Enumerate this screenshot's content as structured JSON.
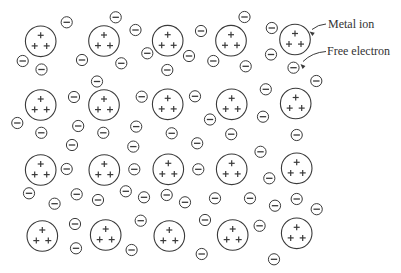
{
  "figure": {
    "colors": {
      "stroke": "#3a3a3a",
      "text": "#333333",
      "background": "#ffffff"
    },
    "ion_radius": 15.3,
    "ion_charge_symbol": "+",
    "ion_charges_per_ion": 3,
    "electron_radius": 5.6,
    "electron_charge_symbol": "−",
    "labels": {
      "metal_ion": {
        "text": "Metal ion",
        "x": 328,
        "y": 27.5
      },
      "free_electron": {
        "text": "Free electron",
        "x": 327,
        "y": 55
      }
    },
    "leaders": [
      {
        "name": "metal-ion-leader",
        "d": "M 326 24 Q 318 24.5 312 29.5",
        "tip": [
          309.5,
          31.5
        ],
        "angle": 145
      },
      {
        "name": "free-electron-leader",
        "d": "M 326 51.5 Q 312 52.5 303 61.5",
        "tip": [
          300.5,
          64
        ],
        "angle": 135
      }
    ],
    "metal_ions": [
      {
        "x": 40.7,
        "y": 41.3
      },
      {
        "x": 104.0,
        "y": 41.0
      },
      {
        "x": 167.7,
        "y": 40.7
      },
      {
        "x": 231.0,
        "y": 40.7
      },
      {
        "x": 295.0,
        "y": 39.5
      },
      {
        "x": 40.7,
        "y": 105.0
      },
      {
        "x": 104.0,
        "y": 105.0
      },
      {
        "x": 167.7,
        "y": 104.3
      },
      {
        "x": 231.7,
        "y": 104.3
      },
      {
        "x": 295.7,
        "y": 103.5
      },
      {
        "x": 40.7,
        "y": 170.0
      },
      {
        "x": 104.3,
        "y": 170.0
      },
      {
        "x": 168.3,
        "y": 169.3
      },
      {
        "x": 231.7,
        "y": 169.3
      },
      {
        "x": 296.7,
        "y": 168.3
      },
      {
        "x": 42.3,
        "y": 236.0
      },
      {
        "x": 105.7,
        "y": 235.0
      },
      {
        "x": 169.3,
        "y": 236.0
      },
      {
        "x": 232.7,
        "y": 235.0
      },
      {
        "x": 296.7,
        "y": 233.3
      }
    ],
    "free_electrons": [
      {
        "x": 66.7,
        "y": 22.3
      },
      {
        "x": 115.7,
        "y": 17.3
      },
      {
        "x": 135.5,
        "y": 30.0
      },
      {
        "x": 22.7,
        "y": 61.0
      },
      {
        "x": 41.5,
        "y": 69.5
      },
      {
        "x": 82.0,
        "y": 60.0
      },
      {
        "x": 121.3,
        "y": 63.3
      },
      {
        "x": 97.0,
        "y": 81.5
      },
      {
        "x": 147.3,
        "y": 53.3
      },
      {
        "x": 167.3,
        "y": 70.0
      },
      {
        "x": 189.0,
        "y": 56.0
      },
      {
        "x": 201.0,
        "y": 31.0
      },
      {
        "x": 244.5,
        "y": 17.0
      },
      {
        "x": 213.3,
        "y": 61.0
      },
      {
        "x": 245.7,
        "y": 66.3
      },
      {
        "x": 271.8,
        "y": 28.0
      },
      {
        "x": 271.0,
        "y": 54.5
      },
      {
        "x": 293.5,
        "y": 67.7
      },
      {
        "x": 316.3,
        "y": 81.0
      },
      {
        "x": 265.8,
        "y": 89.3
      },
      {
        "x": 74.0,
        "y": 97.0
      },
      {
        "x": 17.3,
        "y": 123.0
      },
      {
        "x": 41.3,
        "y": 132.8
      },
      {
        "x": 78.2,
        "y": 126.0
      },
      {
        "x": 103.3,
        "y": 132.8
      },
      {
        "x": 72.0,
        "y": 145.0
      },
      {
        "x": 136.2,
        "y": 126.6
      },
      {
        "x": 133.3,
        "y": 146.6
      },
      {
        "x": 141.7,
        "y": 96.7
      },
      {
        "x": 195.0,
        "y": 96.3
      },
      {
        "x": 210.0,
        "y": 119.5
      },
      {
        "x": 171.7,
        "y": 133.3
      },
      {
        "x": 231.2,
        "y": 134.2
      },
      {
        "x": 197.2,
        "y": 143.3
      },
      {
        "x": 263.0,
        "y": 116.7
      },
      {
        "x": 296.7,
        "y": 135.0
      },
      {
        "x": 260.5,
        "y": 151.8
      },
      {
        "x": 66.7,
        "y": 169.0
      },
      {
        "x": 29.0,
        "y": 193.3
      },
      {
        "x": 54.6,
        "y": 203.7
      },
      {
        "x": 76.7,
        "y": 194.3
      },
      {
        "x": 98.0,
        "y": 200.0
      },
      {
        "x": 125.8,
        "y": 191.3
      },
      {
        "x": 134.3,
        "y": 169.3
      },
      {
        "x": 198.3,
        "y": 169.3
      },
      {
        "x": 144.0,
        "y": 197.3
      },
      {
        "x": 166.7,
        "y": 195.0
      },
      {
        "x": 185.0,
        "y": 202.3
      },
      {
        "x": 215.0,
        "y": 198.3
      },
      {
        "x": 250.0,
        "y": 198.3
      },
      {
        "x": 269.3,
        "y": 178.3
      },
      {
        "x": 275.0,
        "y": 205.7
      },
      {
        "x": 296.7,
        "y": 199.0
      },
      {
        "x": 316.7,
        "y": 209.2
      },
      {
        "x": 75.0,
        "y": 224.0
      },
      {
        "x": 76.0,
        "y": 248.3
      },
      {
        "x": 131.6,
        "y": 250.0
      },
      {
        "x": 140.7,
        "y": 220.7
      },
      {
        "x": 205.0,
        "y": 220.0
      },
      {
        "x": 201.7,
        "y": 254.0
      },
      {
        "x": 259.6,
        "y": 225.8
      },
      {
        "x": 274.0,
        "y": 259.3
      }
    ]
  }
}
